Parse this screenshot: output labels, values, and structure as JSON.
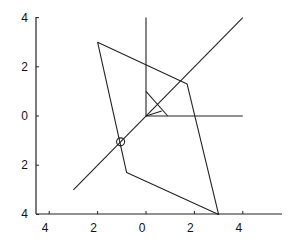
{
  "diagram": {
    "type": "geometric-figure-on-axes",
    "y_axis": {
      "tick_labels": [
        "4",
        "2",
        "0",
        "2",
        "4"
      ],
      "tick_values": [
        4,
        2,
        0,
        -2,
        -4
      ]
    },
    "x_axis": {
      "tick_labels": [
        "4",
        "2",
        "0",
        "2",
        "4"
      ],
      "tick_values": [
        -4,
        -2,
        0,
        2,
        4
      ]
    },
    "elements": {
      "diagonal_line": {
        "from": [
          -3.0,
          -3.0
        ],
        "to": [
          4.0,
          4.0
        ]
      },
      "vertical_ray": {
        "from": [
          0,
          0
        ],
        "to": [
          0,
          4.0
        ]
      },
      "horizontal_ray": {
        "from": [
          0,
          0
        ],
        "to": [
          4.0,
          0
        ]
      },
      "quadrilateral": [
        [
          -2.0,
          3.0
        ],
        [
          1.7,
          1.3
        ],
        [
          3.0,
          -4.0
        ],
        [
          -0.8,
          -2.3
        ]
      ],
      "origin_marker_lines": [
        {
          "from": [
            0,
            1.0
          ],
          "to": [
            0.9,
            0
          ]
        },
        {
          "from": [
            0,
            0
          ],
          "to": [
            0.65,
            0.2
          ]
        }
      ],
      "circle_marker": {
        "center": [
          -1.05,
          -1.05
        ],
        "label": ""
      }
    }
  }
}
